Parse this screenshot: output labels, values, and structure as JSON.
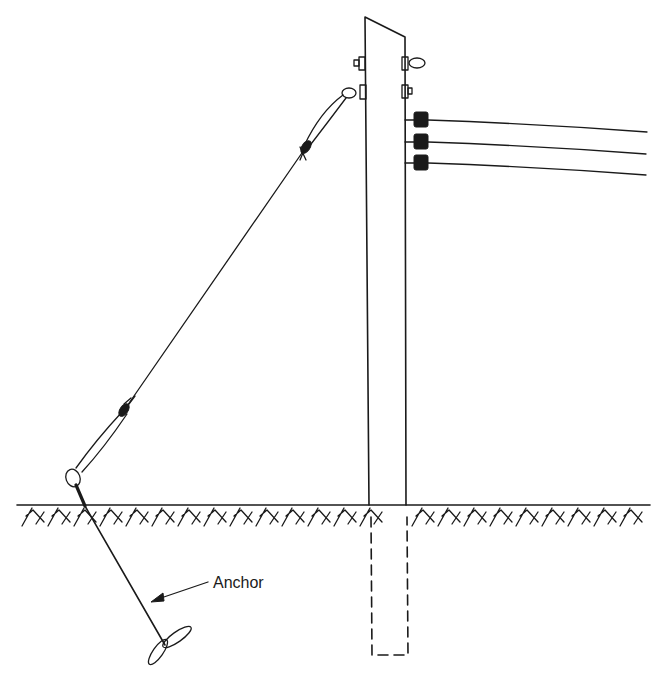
{
  "diagram": {
    "labels": {
      "anchor": "Anchor"
    },
    "components": [
      "utility-pole",
      "pole-butt-below-ground",
      "ground-line",
      "soil-hatching",
      "crossarm-insulators",
      "conductor-lines",
      "guy-wire",
      "guy-wire-grips",
      "anchor-rod",
      "anchor-helix"
    ],
    "colors": {
      "ink": "#1a1a1a",
      "background": "#ffffff"
    }
  }
}
